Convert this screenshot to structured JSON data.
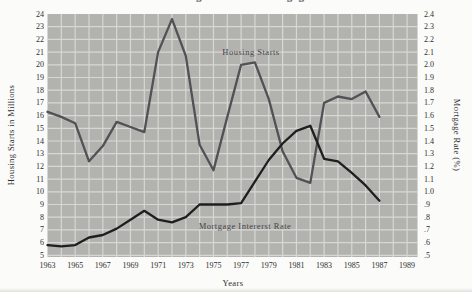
{
  "title": "Housing Starts and Mortgage Interest Rates",
  "colors": {
    "page_bg": "#fbfbf9",
    "plot_bg": "#b2b2af",
    "grid": "#d7d7d3",
    "housing_line": "#525256",
    "mortgage_line": "#1f1f1f",
    "tick_text": "#2e2e2e"
  },
  "chart_data": {
    "type": "line",
    "x": [
      1963,
      1964,
      1965,
      1966,
      1967,
      1968,
      1969,
      1970,
      1971,
      1972,
      1973,
      1974,
      1975,
      1976,
      1977,
      1978,
      1979,
      1980,
      1981,
      1982,
      1983,
      1984,
      1985,
      1986,
      1987
    ],
    "series": [
      {
        "name": "Housing Starts",
        "axis": "left",
        "color": "#525256",
        "values": [
          16.3,
          15.9,
          15.4,
          12.4,
          13.6,
          15.5,
          15.1,
          14.7,
          21.0,
          23.6,
          20.7,
          13.7,
          11.7,
          15.9,
          20.0,
          20.2,
          17.3,
          13.2,
          11.1,
          10.7,
          17.0,
          17.5,
          17.3,
          17.9,
          15.9
        ]
      },
      {
        "name": "Mortgage Intererst Rate",
        "axis": "right",
        "color": "#1f1f1f",
        "values": [
          0.58,
          0.57,
          0.58,
          0.64,
          0.66,
          0.71,
          0.78,
          0.85,
          0.78,
          0.76,
          0.8,
          0.9,
          0.9,
          0.9,
          0.91,
          1.08,
          1.25,
          1.38,
          1.48,
          1.52,
          1.26,
          1.24,
          1.15,
          1.05,
          0.93
        ]
      }
    ],
    "left_axis": {
      "label": "Housing Starts in Millions",
      "min": 5,
      "max": 24,
      "step": 1,
      "ticks": [
        "24",
        "23",
        "22",
        "21",
        "20",
        "19",
        "18",
        "17",
        "16",
        "15",
        "14",
        "13",
        "12",
        "11",
        "10",
        "9",
        "8",
        "7",
        "6",
        "5"
      ]
    },
    "right_axis": {
      "label": "Mortgage Rate (%)",
      "min": 0.5,
      "max": 2.4,
      "step": 0.1,
      "ticks": [
        "2.4",
        "2.3",
        "2.2",
        "2.1",
        "2.0",
        "1.9",
        "1.8",
        "1.7",
        "1.6",
        "1.5",
        "1.4",
        "1.3",
        "1.2",
        "1.1",
        "1.0",
        ".9",
        ".8",
        ".7",
        ".6",
        ".5"
      ]
    },
    "x_axis": {
      "label": "Years",
      "min": 1963,
      "max": 1989,
      "ticks": [
        "1963",
        "1965",
        "1967",
        "1969",
        "1971",
        "1973",
        "1975",
        "1977",
        "1979",
        "1981",
        "1983",
        "1985",
        "1987",
        "1989"
      ]
    },
    "grid": true,
    "legend_position": "inline-labels"
  }
}
